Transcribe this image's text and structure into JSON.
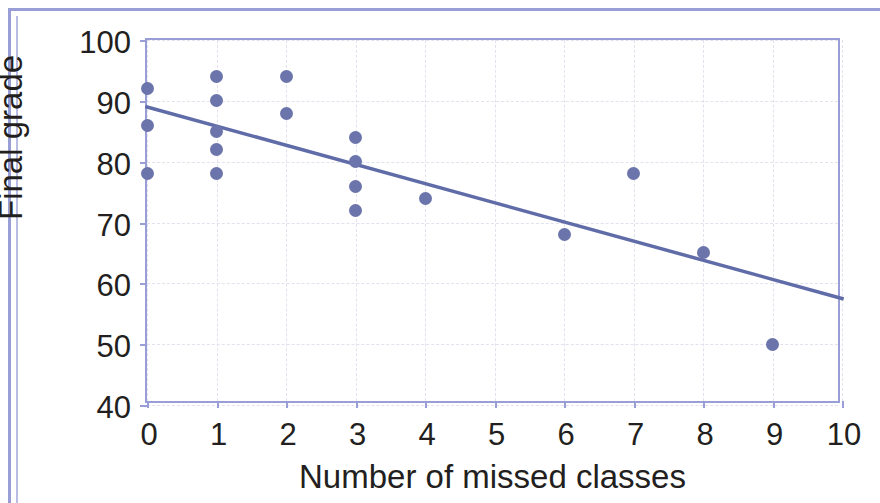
{
  "chart_data": {
    "type": "scatter",
    "title": "",
    "xlabel": "Number of missed classes",
    "ylabel": "Final grade",
    "xlim": [
      0,
      10
    ],
    "ylim": [
      40,
      100
    ],
    "xticks": [
      0,
      1,
      2,
      3,
      4,
      5,
      6,
      7,
      8,
      9,
      10
    ],
    "xtick_labels": [
      "0",
      "1",
      "2",
      "3",
      "4",
      "5",
      "6",
      "7",
      "8",
      "9",
      "10"
    ],
    "yticks": [
      40,
      50,
      60,
      70,
      80,
      90,
      100
    ],
    "ytick_labels": [
      "40",
      "50",
      "60",
      "70",
      "80",
      "90",
      "100"
    ],
    "grid": true,
    "legend": "none",
    "points": [
      {
        "x": 0,
        "y": 92
      },
      {
        "x": 0,
        "y": 86
      },
      {
        "x": 0,
        "y": 78
      },
      {
        "x": 1,
        "y": 94
      },
      {
        "x": 1,
        "y": 90
      },
      {
        "x": 1,
        "y": 85
      },
      {
        "x": 1,
        "y": 82
      },
      {
        "x": 1,
        "y": 78
      },
      {
        "x": 2,
        "y": 94
      },
      {
        "x": 2,
        "y": 88
      },
      {
        "x": 3,
        "y": 84
      },
      {
        "x": 3,
        "y": 80
      },
      {
        "x": 3,
        "y": 76
      },
      {
        "x": 3,
        "y": 72
      },
      {
        "x": 4,
        "y": 74
      },
      {
        "x": 6,
        "y": 68
      },
      {
        "x": 7,
        "y": 78
      },
      {
        "x": 8,
        "y": 65
      },
      {
        "x": 9,
        "y": 50
      }
    ],
    "trendline": {
      "type": "linear",
      "x_start": 0,
      "y_start": 89,
      "x_end": 10,
      "y_end": 57.5
    },
    "colors": {
      "marker": "#6b74ab",
      "trendline": "#606ca8",
      "axis": "#9a9ed6",
      "gridline": "#e2e2ee",
      "text": "#231f20",
      "background": "#ffffff",
      "frame": "#9a9ed6"
    }
  }
}
